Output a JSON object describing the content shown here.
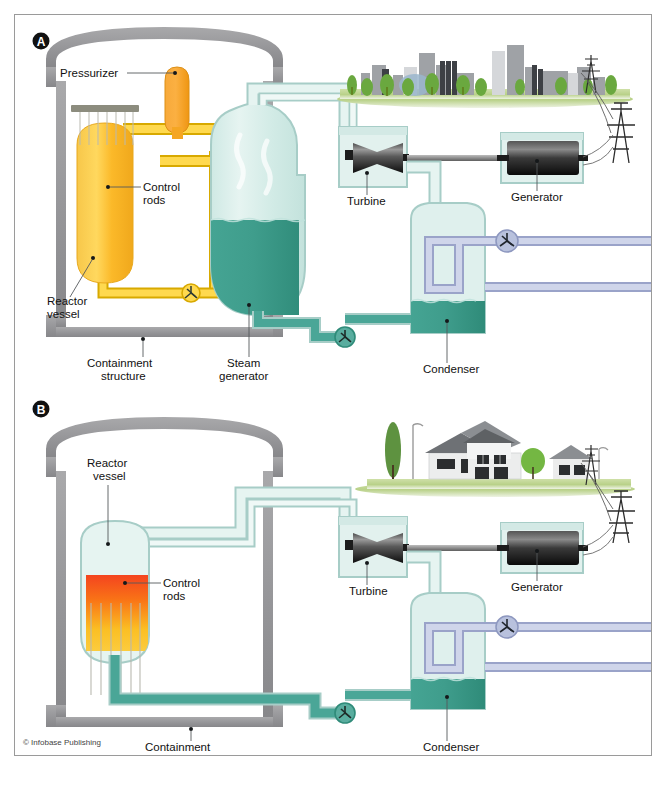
{
  "figure": {
    "copyright": "© Infobase Publishing",
    "panels": [
      {
        "id": "A",
        "badge": "A",
        "type": "pressurized-water-reactor",
        "labels": {
          "pressurizer": "Pressurizer",
          "control_rods_line1": "Control",
          "control_rods_line2": "rods",
          "reactor_vessel_line1": "Reactor",
          "reactor_vessel_line2": "vessel",
          "containment_line1": "Containment",
          "containment_line2": "structure",
          "steam_generator_line1": "Steam",
          "steam_generator_line2": "generator",
          "turbine": "Turbine",
          "generator": "Generator",
          "condenser": "Condenser"
        },
        "scene": "city-skyline"
      },
      {
        "id": "B",
        "badge": "B",
        "type": "boiling-water-reactor",
        "labels": {
          "reactor_vessel_line1": "Reactor",
          "reactor_vessel_line2": "vessel",
          "control_rods_line1": "Control",
          "control_rods_line2": "rods",
          "containment_line1": "Containment",
          "containment_line2": "structure",
          "turbine": "Turbine",
          "generator": "Generator",
          "condenser": "Condenser"
        },
        "scene": "suburban-houses"
      }
    ]
  },
  "colors": {
    "containment_wall": "#9a9a9c",
    "hot_loop": "#f2c200",
    "hot_loop_light": "#ffe97a",
    "reactor_orange": "#f5a623",
    "reactor_yellow": "#ffd24a",
    "pressurizer": "#f5a01f",
    "steam_pale": "#d9efec",
    "water_teal": "#3fa391",
    "water_teal_dark": "#2e8f7e",
    "coolant_pipe": "#b8bfdd",
    "pipe_outline": "#a8c6c6",
    "grass": "#b6cf8e",
    "building_grey": "#8f9194",
    "tree_green": "#5fa33c",
    "machine_dark": "#2b2b2b",
    "label_text": "#111111"
  }
}
